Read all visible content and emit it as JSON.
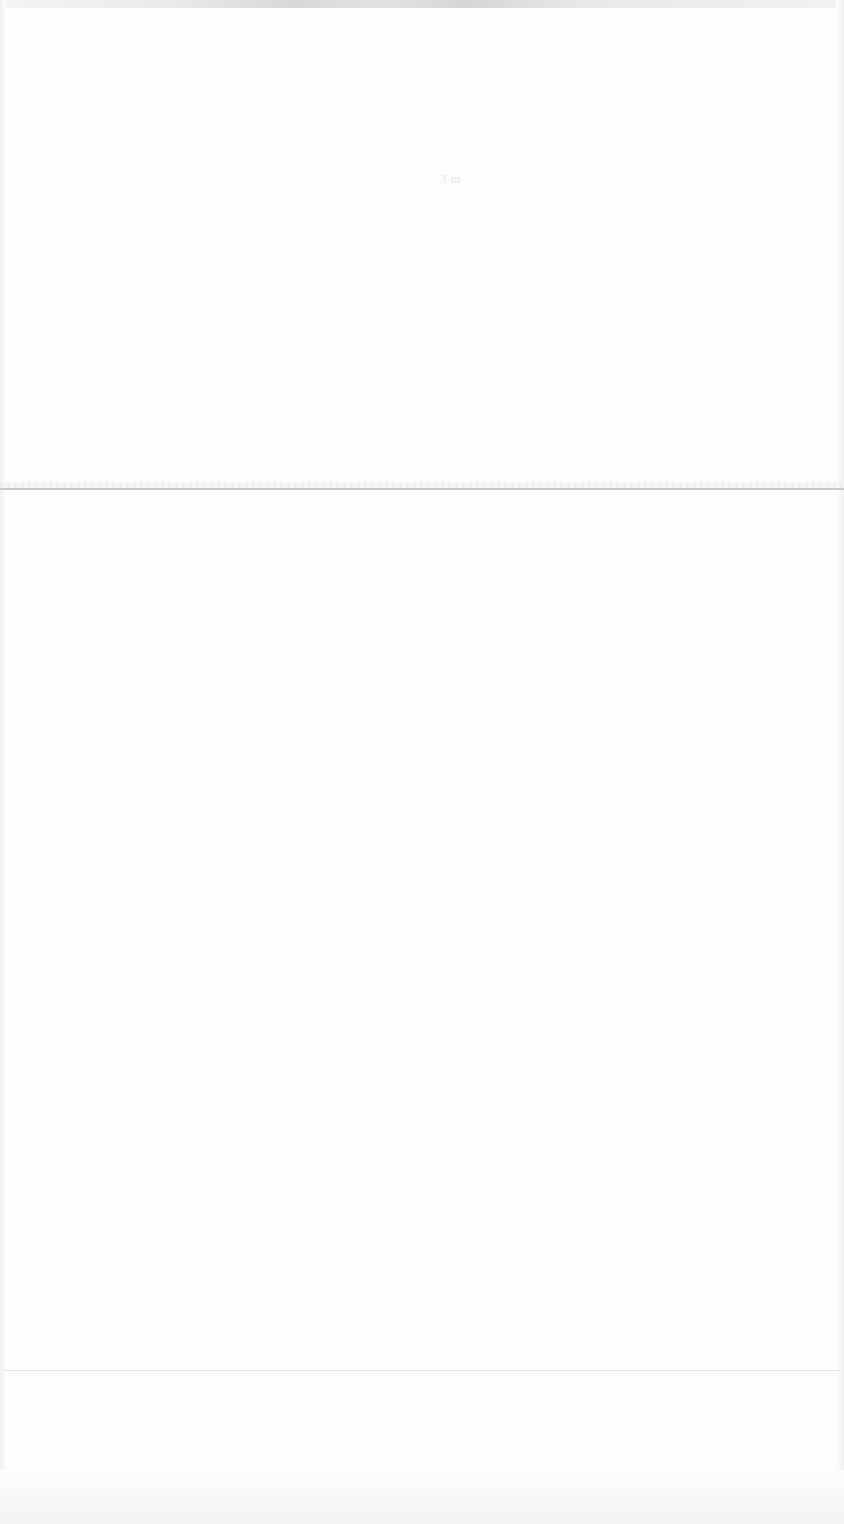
{
  "page": {
    "faint_text": "3 m"
  }
}
